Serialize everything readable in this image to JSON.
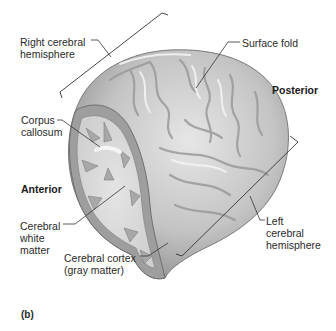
{
  "figure": {
    "panel_label": "(b)"
  },
  "labels": {
    "right_hemisphere": "Right cerebral\nhemisphere",
    "surface_fold": "Surface fold",
    "posterior": "Posterior",
    "corpus_callosum": "Corpus\ncallosum",
    "anterior": "Anterior",
    "white_matter": "Cerebral\nwhite\nmatter",
    "cortex": "Cerebral cortex\n(gray matter)",
    "left_hemisphere": "Left\ncerebral\nhemisphere"
  },
  "colors": {
    "background": "#ffffff",
    "brain_surface": "#c9c9c9",
    "brain_highlight": "#ececec",
    "brain_shadow": "#8f8f8f",
    "white_matter": "#dcdcdc",
    "gray_matter": "#9e9e9e",
    "leader_line": "#333333",
    "text": "#2a2a2a"
  }
}
